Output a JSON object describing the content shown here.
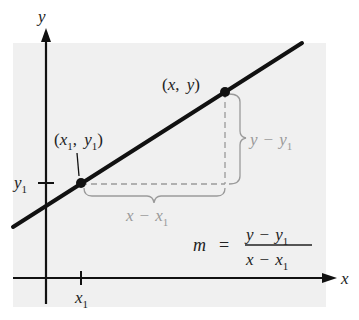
{
  "diagram": {
    "colors": {
      "background": "#ffffff",
      "panel": "#f0f0f0",
      "ink": "#111111",
      "guide": "#9a9a9a"
    },
    "axes": {
      "x_label": "x",
      "y_label": "y",
      "x_tick_label": "x",
      "x_tick_sub": "1",
      "y_tick_label": "y",
      "y_tick_sub": "1"
    },
    "points": [
      {
        "id": "p1",
        "label_parts": [
          "(",
          "x",
          "1",
          ", ",
          "y",
          "1",
          ")"
        ],
        "text": "(x1, y1)"
      },
      {
        "id": "p2",
        "label_parts": [
          "(x, y)"
        ],
        "text": "(x, y)"
      }
    ],
    "rise_label": {
      "a": "y",
      "op": "−",
      "b": "y",
      "b_sub": "1"
    },
    "run_label": {
      "a": "x",
      "op": "−",
      "b": "x",
      "b_sub": "1"
    },
    "formula": {
      "lhs": "m",
      "eq": "=",
      "num_a": "y",
      "num_op": "−",
      "num_b": "y",
      "num_sub": "1",
      "den_a": "x",
      "den_op": "−",
      "den_b": "x",
      "den_sub": "1"
    }
  }
}
